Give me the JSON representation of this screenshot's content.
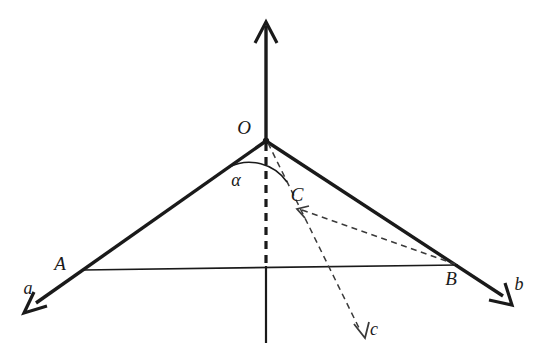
{
  "figure": {
    "type": "geometry-diagram",
    "background_color": "#ffffff",
    "ink_color": "#1a1a1a",
    "canvas": {
      "width": 548,
      "height": 363
    }
  },
  "points": {
    "O": {
      "label": "O",
      "x": 266,
      "y": 141,
      "label_x": 244,
      "label_y": 134
    },
    "A": {
      "label": "A",
      "x": 85,
      "y": 269,
      "label_x": 60,
      "label_y": 270
    },
    "B": {
      "label": "B",
      "x": 455,
      "y": 265,
      "label_x": 451,
      "label_y": 285
    },
    "C": {
      "label": "C",
      "x": 300,
      "y": 208,
      "label_x": 297,
      "label_y": 201
    }
  },
  "rays": [
    {
      "name": "ray-a",
      "label": "a",
      "label_x": 28,
      "label_y": 294,
      "from": "O",
      "through": "A",
      "tip_x": 24,
      "tip_y": 313,
      "style": "solid"
    },
    {
      "name": "ray-b",
      "label": "b",
      "label_x": 519,
      "label_y": 290,
      "from": "O",
      "through": "B",
      "tip_x": 512,
      "tip_y": 305,
      "style": "solid"
    },
    {
      "name": "ray-c",
      "label": "c",
      "label_x": 372,
      "label_y": 335,
      "from": "O",
      "through": "C",
      "tip_x": 365,
      "tip_y": 338,
      "style": "dashed"
    }
  ],
  "axis": {
    "name": "vertical-axis",
    "top_tip_x": 266,
    "top_tip_y": 22,
    "bottom_x": 266,
    "bottom_y": 343,
    "dashed_from_y": 141,
    "dashed_to_y": 268
  },
  "segments": [
    {
      "name": "segment-AB",
      "from": "A",
      "to": "B",
      "style": "solid"
    },
    {
      "name": "segment-CB",
      "from": "C",
      "to": "B",
      "style": "dashed"
    }
  ],
  "angle": {
    "name": "angle-alpha",
    "label": "α",
    "label_x": 236,
    "label_y": 186,
    "vertex": "O",
    "arc_radius": 45,
    "between": [
      "ray-a",
      "ray-c"
    ]
  }
}
